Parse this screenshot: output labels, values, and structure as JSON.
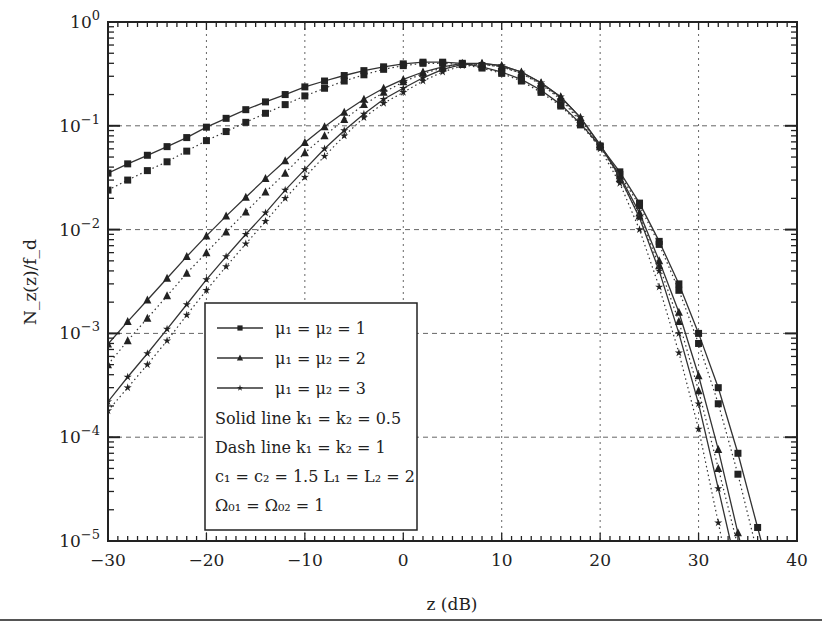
{
  "chart_data": {
    "type": "line",
    "title": "",
    "xlabel": "z (dB)",
    "ylabel": "N_z(z)/f_d",
    "xlim": [
      -30,
      40
    ],
    "ylim": [
      1e-05,
      1
    ],
    "yscale": "log",
    "grid": true,
    "x_ticks": [
      -30,
      -20,
      -10,
      0,
      10,
      20,
      30,
      40
    ],
    "x_tick_labels": [
      "−30",
      "−20",
      "−10",
      "0",
      "10",
      "20",
      "30",
      "40"
    ],
    "y_ticks": [
      1,
      0.1,
      0.01,
      0.001,
      0.0001,
      1e-05
    ],
    "y_tick_labels": [
      {
        "base": "10",
        "exp": "0"
      },
      {
        "base": "10",
        "exp": "−1"
      },
      {
        "base": "10",
        "exp": "−2"
      },
      {
        "base": "10",
        "exp": "−3"
      },
      {
        "base": "10",
        "exp": "−4"
      },
      {
        "base": "10",
        "exp": "−5"
      }
    ],
    "legend_position": "lower-left-inside",
    "legend": {
      "entries": [
        {
          "marker": "square",
          "label": "μ₁ = μ₂ = 1"
        },
        {
          "marker": "triangle",
          "label": "μ₁ = μ₂ = 2"
        },
        {
          "marker": "star",
          "label": "μ₁ = μ₂ = 3"
        }
      ],
      "notes": [
        "Solid line k₁ = k₂ = 0.5",
        "Dash line k₁ = k₂ = 1",
        "c₁ = c₂ = 1.5  L₁ = L₂ = 2",
        "Ω₀₁ = Ω₀₂ = 1"
      ]
    },
    "x": [
      -30,
      -28,
      -26,
      -24,
      -22,
      -20,
      -18,
      -16,
      -14,
      -12,
      -10,
      -8,
      -6,
      -4,
      -2,
      0,
      2,
      4,
      6,
      8,
      10,
      12,
      14,
      16,
      18,
      20,
      22,
      24,
      26,
      28,
      30,
      32,
      34,
      36
    ],
    "series": [
      {
        "name": "mu=1 solid (k=0.5)",
        "marker": "square",
        "style": "solid",
        "values": [
          0.035,
          0.043,
          0.052,
          0.063,
          0.077,
          0.097,
          0.118,
          0.143,
          0.17,
          0.2,
          0.237,
          0.27,
          0.305,
          0.34,
          0.37,
          0.395,
          0.41,
          0.41,
          0.4,
          0.37,
          0.33,
          0.28,
          0.22,
          0.16,
          0.105,
          0.064,
          0.036,
          0.018,
          0.0077,
          0.003,
          0.001,
          0.0003,
          7e-05,
          1.35e-05
        ]
      },
      {
        "name": "mu=1 dashed (k=1)",
        "marker": "square",
        "style": "dotted",
        "values": [
          0.024,
          0.03,
          0.037,
          0.045,
          0.057,
          0.072,
          0.088,
          0.108,
          0.132,
          0.16,
          0.194,
          0.23,
          0.27,
          0.31,
          0.35,
          0.38,
          0.4,
          0.4,
          0.39,
          0.36,
          0.32,
          0.27,
          0.21,
          0.155,
          0.102,
          0.063,
          0.034,
          0.017,
          0.0072,
          0.0026,
          0.0008,
          0.00021,
          4.4e-05,
          7.5e-06
        ]
      },
      {
        "name": "mu=2 solid (k=0.5)",
        "marker": "triangle",
        "style": "solid",
        "values": [
          0.00079,
          0.0013,
          0.0021,
          0.0034,
          0.0055,
          0.0087,
          0.0135,
          0.0205,
          0.031,
          0.046,
          0.069,
          0.098,
          0.135,
          0.18,
          0.23,
          0.28,
          0.33,
          0.37,
          0.4,
          0.4,
          0.38,
          0.33,
          0.26,
          0.19,
          0.12,
          0.066,
          0.033,
          0.0145,
          0.005,
          0.0016,
          0.00039,
          7.6e-05,
          1.2e-05,
          null
        ]
      },
      {
        "name": "mu=2 dashed (k=1)",
        "marker": "triangle",
        "style": "dotted",
        "values": [
          0.0005,
          0.00085,
          0.0014,
          0.0023,
          0.0038,
          0.006,
          0.0095,
          0.0148,
          0.023,
          0.035,
          0.055,
          0.08,
          0.115,
          0.16,
          0.21,
          0.265,
          0.32,
          0.36,
          0.39,
          0.39,
          0.37,
          0.32,
          0.255,
          0.185,
          0.115,
          0.063,
          0.031,
          0.0135,
          0.0045,
          0.0013,
          0.00028,
          5e-05,
          null,
          null
        ]
      },
      {
        "name": "mu=3 solid (k=0.5)",
        "marker": "star",
        "style": "solid",
        "values": [
          0.00022,
          0.00038,
          0.00064,
          0.0011,
          0.0019,
          0.0033,
          0.0055,
          0.009,
          0.0145,
          0.024,
          0.038,
          0.06,
          0.09,
          0.13,
          0.18,
          0.23,
          0.29,
          0.35,
          0.39,
          0.4,
          0.38,
          0.33,
          0.26,
          0.19,
          0.12,
          0.065,
          0.032,
          0.013,
          0.004,
          0.001,
          0.00021,
          3.2e-05,
          null,
          null
        ]
      },
      {
        "name": "mu=3 dashed (k=1)",
        "marker": "star",
        "style": "dotted",
        "values": [
          0.00018,
          0.0003,
          0.0005,
          0.00085,
          0.0015,
          0.0026,
          0.0044,
          0.0073,
          0.012,
          0.02,
          0.032,
          0.051,
          0.08,
          0.12,
          0.165,
          0.21,
          0.27,
          0.33,
          0.38,
          0.39,
          0.37,
          0.32,
          0.25,
          0.18,
          0.11,
          0.06,
          0.028,
          0.01,
          0.0028,
          0.00065,
          0.00012,
          1.5e-05,
          null,
          null
        ]
      }
    ]
  },
  "colors": {
    "line": "#333333",
    "grid": "#666666",
    "frame": "#222222",
    "background": "#ffffff"
  }
}
